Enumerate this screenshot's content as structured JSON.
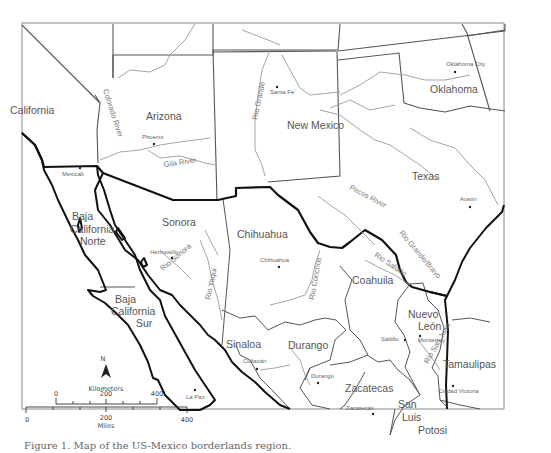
{
  "map": {
    "states_us": [
      {
        "name": "California",
        "x": 10,
        "y": 114
      },
      {
        "name": "Arizona",
        "x": 146,
        "y": 120
      },
      {
        "name": "New Mexico",
        "x": 287,
        "y": 129
      },
      {
        "name": "Oklahoma",
        "x": 430,
        "y": 93
      },
      {
        "name": "Texas",
        "x": 412,
        "y": 180
      }
    ],
    "states_mx": [
      {
        "name": "Baja",
        "x": 72,
        "y": 220
      },
      {
        "name": "California",
        "x": 70,
        "y": 233
      },
      {
        "name": "Norte",
        "x": 80,
        "y": 245
      },
      {
        "name": "Sonora",
        "x": 162,
        "y": 226
      },
      {
        "name": "Chihuahua",
        "x": 237,
        "y": 238
      },
      {
        "name": "Coahuila",
        "x": 352,
        "y": 284
      },
      {
        "name": "Baja",
        "x": 115,
        "y": 303
      },
      {
        "name": "California",
        "x": 111,
        "y": 315
      },
      {
        "name": "Sur",
        "x": 136,
        "y": 327
      },
      {
        "name": "Nuevo",
        "x": 408,
        "y": 318
      },
      {
        "name": "León",
        "x": 418,
        "y": 330
      },
      {
        "name": "Sinaloa",
        "x": 226,
        "y": 348
      },
      {
        "name": "Durango",
        "x": 288,
        "y": 349
      },
      {
        "name": "Tamaulipas",
        "x": 443,
        "y": 368
      },
      {
        "name": "Zacatecas",
        "x": 345,
        "y": 392
      },
      {
        "name": "San",
        "x": 398,
        "y": 408
      },
      {
        "name": "Luis",
        "x": 402,
        "y": 421
      },
      {
        "name": "Potosi",
        "x": 418,
        "y": 434
      }
    ],
    "cities": [
      {
        "name": "Phoenix",
        "x": 154,
        "y": 144,
        "lx": 142,
        "ly": 139
      },
      {
        "name": "Santa Fe",
        "x": 277,
        "y": 87,
        "lx": 270,
        "ly": 94
      },
      {
        "name": "Oklahoma City",
        "x": 455,
        "y": 72,
        "lx": 446,
        "ly": 66
      },
      {
        "name": "Austin",
        "x": 470,
        "y": 207,
        "lx": 460,
        "ly": 201
      },
      {
        "name": "Mexicali",
        "x": 80,
        "y": 168,
        "lx": 62,
        "ly": 176
      },
      {
        "name": "Hermosillo",
        "x": 172,
        "y": 258,
        "lx": 150,
        "ly": 254
      },
      {
        "name": "Chihuahua",
        "x": 279,
        "y": 267,
        "lx": 260,
        "ly": 262
      },
      {
        "name": "Culiacán",
        "x": 257,
        "y": 369,
        "lx": 243,
        "ly": 363
      },
      {
        "name": "Durango",
        "x": 318,
        "y": 383,
        "lx": 311,
        "ly": 378
      },
      {
        "name": "Saltillo",
        "x": 405,
        "y": 340,
        "lx": 381,
        "ly": 341
      },
      {
        "name": "Monterrey",
        "x": 420,
        "y": 336,
        "lx": 418,
        "ly": 342
      },
      {
        "name": "Zacatecas",
        "x": 373,
        "y": 414,
        "lx": 346,
        "ly": 410
      },
      {
        "name": "Ciudad Victoria",
        "x": 453,
        "y": 386,
        "lx": 438,
        "ly": 393
      },
      {
        "name": "La Paz",
        "x": 195,
        "y": 390,
        "lx": 186,
        "ly": 399
      }
    ],
    "rivers": [
      {
        "name": "Colorado River",
        "x": 103,
        "y": 90,
        "rot": 72
      },
      {
        "name": "Gila River",
        "x": 164,
        "y": 167,
        "rot": -8
      },
      {
        "name": "Rio Grande",
        "x": 257,
        "y": 120,
        "rot": -78
      },
      {
        "name": "Pecos River",
        "x": 349,
        "y": 189,
        "rot": 28
      },
      {
        "name": "Rio Sonora",
        "x": 163,
        "y": 271,
        "rot": -40
      },
      {
        "name": "Rio Yaqui",
        "x": 210,
        "y": 300,
        "rot": -78
      },
      {
        "name": "Rio Conchos",
        "x": 314,
        "y": 300,
        "rot": -80
      },
      {
        "name": "Rio Salado",
        "x": 374,
        "y": 256,
        "rot": 34
      },
      {
        "name": "Rio Grande/Bravo",
        "x": 399,
        "y": 233,
        "rot": 50
      },
      {
        "name": "Rio San Juan",
        "x": 428,
        "y": 364,
        "rot": -60
      }
    ]
  },
  "north_arrow": {
    "label": "N"
  },
  "scale": {
    "km_label": "Kilometers",
    "km_ticks": [
      "0",
      "200",
      "400"
    ],
    "mi_label": "Miles",
    "mi_ticks": [
      "0",
      "200",
      "400"
    ]
  },
  "caption": "Figure 1. Map of the US-Mexico borderlands region."
}
